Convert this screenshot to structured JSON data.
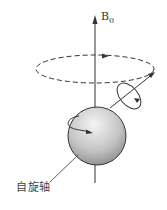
{
  "diagram": {
    "field_label": "B",
    "field_subscript": "0",
    "spin_axis_label": "自旋轴",
    "colors": {
      "line": "#333333",
      "sphere_light": "#f2f2f2",
      "sphere_dark": "#8a8a8a"
    }
  }
}
